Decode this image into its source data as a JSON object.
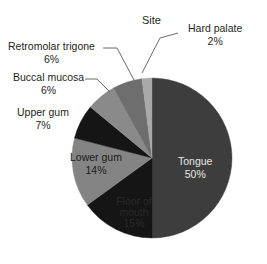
{
  "chart_data": {
    "type": "pie",
    "title": "Site",
    "xlabel": "",
    "ylabel": "",
    "legend": "none",
    "grid": false,
    "units": "percent",
    "categories": [
      "Tongue",
      "Floor of mouth",
      "Lower gum",
      "Upper gum",
      "Buccal mucosa",
      "Retromolar trigone",
      "Hard palate"
    ],
    "values": [
      50,
      15,
      14,
      7,
      6,
      6,
      2
    ],
    "labels": [
      "50%",
      "15%",
      "14%",
      "7%",
      "6%",
      "6%",
      "2%"
    ],
    "start_angle_deg": 0,
    "direction": "clockwise",
    "slices": [
      {
        "name": "Tongue",
        "value": 50,
        "pct_label": "50%",
        "color": "#3d3d3d",
        "label_placement": "inside",
        "label_color": "#e8e8e8"
      },
      {
        "name": "Floor of mouth",
        "value": 15,
        "pct_label": "15%",
        "color": "#151515",
        "label_placement": "inside",
        "label_color": "#2a2a2a"
      },
      {
        "name": "Lower gum",
        "value": 14,
        "pct_label": "14%",
        "color": "#848484",
        "label_placement": "inside",
        "label_color": "#1b1b1b"
      },
      {
        "name": "Upper gum",
        "value": 7,
        "pct_label": "7%",
        "color": "#151515",
        "label_placement": "callout-left",
        "label_color": "#231f20"
      },
      {
        "name": "Buccal mucosa",
        "value": 6,
        "pct_label": "6%",
        "color": "#8a8a8a",
        "label_placement": "callout-left",
        "label_color": "#231f20"
      },
      {
        "name": "Retromolar trigone",
        "value": 6,
        "pct_label": "6%",
        "color": "#6e6e6e",
        "label_placement": "callout-left",
        "label_color": "#231f20"
      },
      {
        "name": "Hard palate",
        "value": 2,
        "pct_label": "2%",
        "color": "#a9a9a9",
        "label_placement": "callout-right",
        "label_color": "#231f20"
      }
    ],
    "colors": [
      "#3d3d3d",
      "#151515",
      "#848484",
      "#151515",
      "#8a8a8a",
      "#6e6e6e",
      "#a9a9a9"
    ],
    "geometry": {
      "center_x": 152,
      "center_y": 158,
      "radius": 80
    },
    "background": "#ffffff",
    "leader_line_color": "#5a5a5a"
  }
}
